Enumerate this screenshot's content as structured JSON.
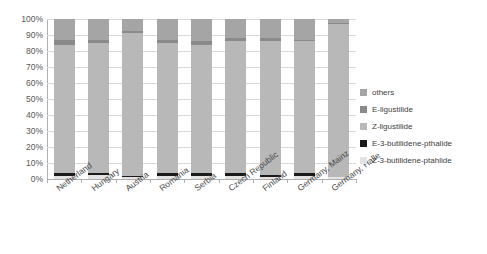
{
  "chart_data": {
    "type": "bar",
    "subtype": "stacked-100-percent",
    "title": "",
    "xlabel": "",
    "ylabel": "",
    "ylim": [
      0,
      100
    ],
    "ytick_labels": [
      "100%",
      "90%",
      "80%",
      "70%",
      "60%",
      "50%",
      "40%",
      "30%",
      "20%",
      "10%",
      "0%"
    ],
    "ytick_values": [
      100,
      90,
      80,
      70,
      60,
      50,
      40,
      30,
      20,
      10,
      0
    ],
    "grid": true,
    "legend_position": "right",
    "categories": [
      "Netherland",
      "Hungary",
      "Austria",
      "Romania",
      "Serbia",
      "Czech Republic",
      "Finland",
      "Germany, Mainz",
      "Germany, Halle"
    ],
    "series": [
      {
        "name": "Z-3-butilidene-ptahlide",
        "color": "#e3e3e3",
        "values": [
          2.0,
          2.5,
          1.0,
          2.0,
          2.0,
          2.0,
          1.5,
          2.0,
          1.0
        ]
      },
      {
        "name": "E-3-butilidene-pthalide",
        "color": "#1a1a1a",
        "values": [
          1.5,
          1.5,
          0.8,
          1.5,
          1.5,
          1.5,
          1.0,
          1.5,
          0.5
        ]
      },
      {
        "name": "Z-ligustilide",
        "color": "#b8b8b8",
        "values": [
          80.5,
          81.0,
          89.2,
          81.5,
          80.5,
          82.5,
          83.5,
          82.5,
          95.5
        ]
      },
      {
        "name": "E-ligustilide",
        "color": "#8a8a8a",
        "values": [
          3.0,
          2.0,
          1.5,
          2.0,
          2.0,
          2.0,
          2.0,
          1.0,
          0.5
        ]
      },
      {
        "name": "others",
        "color": "#a5a5a5",
        "values": [
          13.0,
          13.0,
          7.5,
          13.0,
          14.0,
          12.0,
          12.0,
          13.0,
          2.5
        ]
      }
    ]
  },
  "legend": {
    "items": [
      {
        "label": "others",
        "color": "#a5a5a5"
      },
      {
        "label": "E-ligustilide",
        "color": "#8a8a8a"
      },
      {
        "label": "Z-ligustilide",
        "color": "#b8b8b8"
      },
      {
        "label": "E-3-butilidene-pthalide",
        "color": "#1a1a1a"
      },
      {
        "label": "Z-3-butilidene-ptahlide",
        "color": "#e3e3e3"
      }
    ]
  }
}
